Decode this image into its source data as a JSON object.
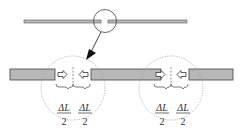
{
  "diagram": {
    "type": "schematic",
    "top_rod": {
      "label": ""
    },
    "detail_views": [
      {
        "id": "left",
        "labels": [
          {
            "numerator": "ΔL",
            "denominator": "2"
          },
          {
            "numerator": "ΔL",
            "denominator": "2"
          }
        ]
      },
      {
        "id": "right",
        "labels": [
          {
            "numerator": "ΔL",
            "denominator": "2"
          },
          {
            "numerator": "ΔL",
            "denominator": "2"
          }
        ]
      }
    ],
    "colors": {
      "rod_fill": "#b8b8b8",
      "rod_stroke": "#555555",
      "circle": "#888888",
      "arrow": "#222222"
    }
  }
}
